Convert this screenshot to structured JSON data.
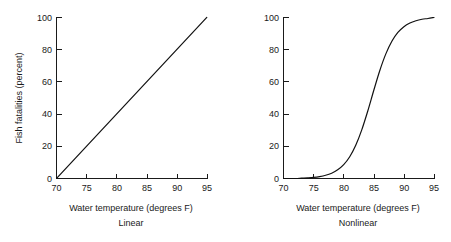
{
  "figure": {
    "background_color": "#ffffff",
    "line_color": "#111111",
    "axis_color": "#1a1a1a"
  },
  "panels": [
    {
      "key": "linear",
      "caption": "Linear",
      "xlabel": "Water temperature (degrees F)",
      "ylabel": "Fish fatalities (percent)",
      "xticks": [
        "70",
        "75",
        "80",
        "85",
        "90",
        "95"
      ],
      "yticks": [
        "0",
        "20",
        "40",
        "60",
        "80",
        "100"
      ]
    },
    {
      "key": "nonlinear",
      "caption": "Nonlinear",
      "xlabel": "Water temperature (degrees F)",
      "ylabel": "",
      "xticks": [
        "70",
        "75",
        "80",
        "85",
        "90",
        "95"
      ],
      "yticks": [
        "0",
        "20",
        "40",
        "60",
        "80",
        "100"
      ]
    }
  ],
  "chart_data": [
    {
      "type": "line",
      "title": "Linear",
      "xlabel": "Water temperature (degrees F)",
      "ylabel": "Fish fatalities (percent)",
      "xlim": [
        70,
        95
      ],
      "ylim": [
        0,
        100
      ],
      "xticks": [
        70,
        75,
        80,
        85,
        90,
        95
      ],
      "yticks": [
        0,
        20,
        40,
        60,
        80,
        100
      ],
      "grid": false,
      "legend": "none",
      "series": [
        {
          "name": "Fish fatalities",
          "x": [
            70,
            75,
            80,
            85,
            90,
            95
          ],
          "values": [
            0,
            20,
            40,
            60,
            80,
            100
          ]
        }
      ]
    },
    {
      "type": "line",
      "title": "Nonlinear",
      "xlabel": "Water temperature (degrees F)",
      "ylabel": "",
      "xlim": [
        70,
        95
      ],
      "ylim": [
        0,
        100
      ],
      "xticks": [
        70,
        75,
        80,
        85,
        90,
        95
      ],
      "yticks": [
        0,
        20,
        40,
        60,
        80,
        100
      ],
      "grid": false,
      "legend": "none",
      "series": [
        {
          "name": "Fish fatalities",
          "x": [
            70,
            71,
            72,
            73,
            74,
            75,
            76,
            77,
            78,
            79,
            80,
            81,
            82,
            83,
            84,
            85,
            86,
            87,
            88,
            89,
            90,
            91,
            92,
            93,
            94,
            95
          ],
          "values": [
            0,
            0,
            0,
            0.2,
            0.4,
            0.7,
            1.2,
            2.0,
            3.3,
            5.4,
            8.6,
            13.5,
            20.6,
            30.2,
            41.9,
            54.8,
            67.1,
            77.4,
            85.2,
            90.7,
            94.3,
            96.6,
            98.0,
            98.9,
            99.4,
            100
          ]
        }
      ]
    }
  ]
}
